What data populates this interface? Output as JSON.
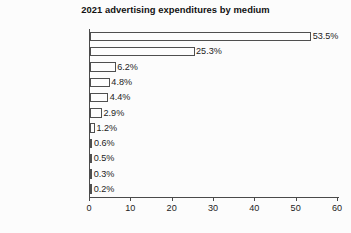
{
  "chart_data": {
    "type": "bar",
    "orientation": "horizontal",
    "title": "2021 advertising expenditures by medium",
    "xlabel": "",
    "ylabel": "",
    "categories": [
      "Internet",
      "TV",
      "Radio",
      "Newspaper",
      "Consumer mag",
      "OOH",
      "Trade",
      "Video games",
      "Digital music",
      "Podcast",
      "Cinema"
    ],
    "values": [
      53.5,
      25.3,
      6.2,
      4.8,
      4.4,
      2.9,
      1.2,
      0.6,
      0.5,
      0.3,
      0.2
    ],
    "data_labels": [
      "53.5%",
      "25.3%",
      "6.2%",
      "4.8%",
      "4.4%",
      "2.9%",
      "1.2%",
      "0.6%",
      "0.5%",
      "0.3%",
      "0.2%"
    ],
    "xlim": [
      0,
      60
    ],
    "xticks": [
      0,
      10,
      20,
      30,
      40,
      50,
      60
    ],
    "xtick_labels": [
      "0",
      "10",
      "20",
      "30",
      "40",
      "50",
      "60"
    ],
    "grid": false,
    "legend": null,
    "bar_fill_color": "#fdfdfd",
    "bar_edge_color": "#4f4f4f",
    "axis_color": "#4a4a4a",
    "background_color": "#fcfcfc",
    "text_color": "#1c1c1c"
  }
}
